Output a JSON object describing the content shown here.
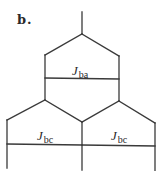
{
  "figure": {
    "panel_label": "b.",
    "line_color": "#3a3a3a",
    "background": "#ffffff"
  },
  "labels": {
    "upper": {
      "symbol": "J",
      "subscript": "ba"
    },
    "lower_left": {
      "symbol": "J",
      "subscript": "bc"
    },
    "lower_right": {
      "symbol": "J",
      "subscript": "bc"
    }
  }
}
